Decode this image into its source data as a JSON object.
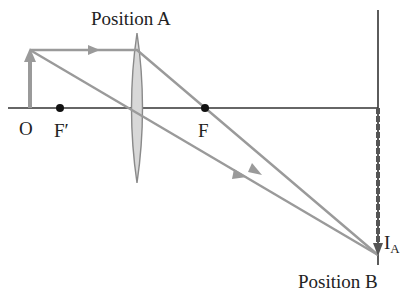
{
  "diagram": {
    "title_label": "Position A",
    "bottom_label": "Position B",
    "labels": {
      "object": "O",
      "front_focal": "F′",
      "back_focal": "F",
      "image_main": "I",
      "image_sub": "A"
    },
    "colors": {
      "ray": "#9a9a9a",
      "axis": "#333333",
      "lens_fill": "#d8d8d8",
      "lens_stroke": "#8a8a8a",
      "focal_dot": "#111111",
      "image_arrow": "#555555"
    },
    "geometry": {
      "axis_y": 108,
      "object_x": 30,
      "object_top_y": 50,
      "lens_x": 137,
      "lens_top_y": 33,
      "lens_bottom_y": 183,
      "front_focal_x": 60,
      "back_focal_x": 205,
      "screen_x": 378,
      "image_tip_y": 255
    }
  }
}
